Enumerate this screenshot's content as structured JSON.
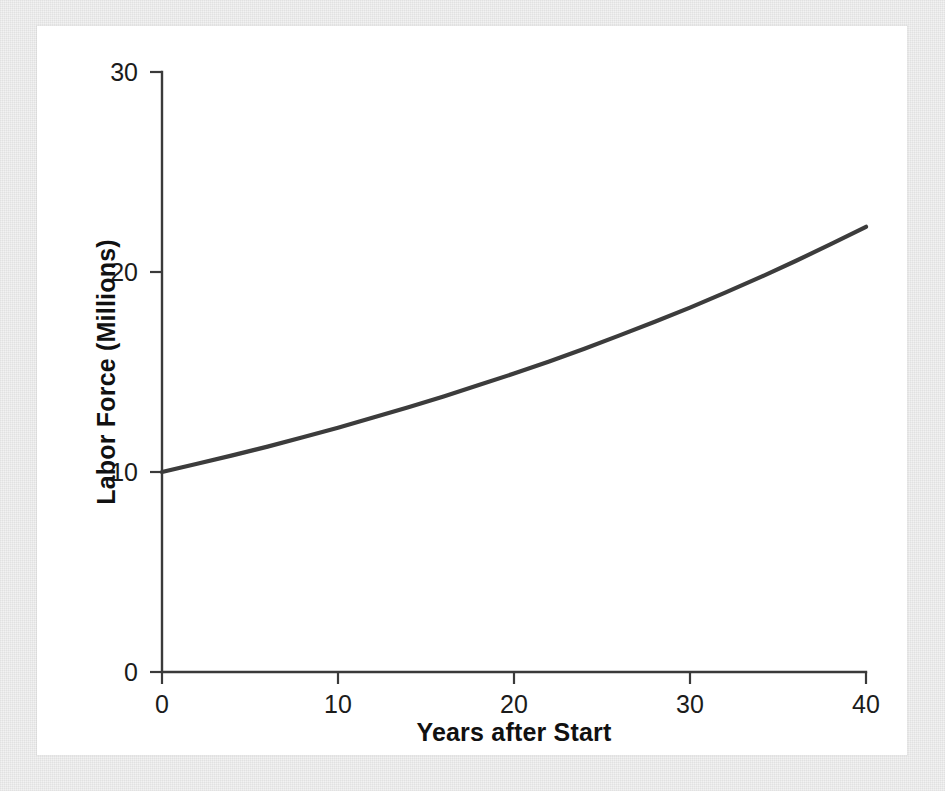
{
  "figure": {
    "background_color": "#f2f2f2",
    "panel_color": "#ffffff",
    "axis_color": "#3a3a3a",
    "curve_color": "#3c3c3c"
  },
  "chart_data": {
    "type": "line",
    "title": "",
    "subtitle": "",
    "xlabel": "Years after Start",
    "ylabel": "Labor Force (Millions)",
    "xlim": [
      0,
      40
    ],
    "ylim": [
      0,
      30
    ],
    "xticks": [
      0,
      10,
      20,
      30,
      40
    ],
    "yticks": [
      0,
      10,
      20,
      30
    ],
    "xtick_labels": [
      "0",
      "10",
      "20",
      "30",
      "40"
    ],
    "ytick_labels": [
      "0",
      "10",
      "20",
      "30"
    ],
    "grid": false,
    "legend": null,
    "legend_position": "none",
    "annotations": [],
    "series": [
      {
        "name": "Labor Force",
        "color": "#3c3c3c",
        "line_width": 4.2,
        "x": [
          0,
          2,
          4,
          6,
          8,
          10,
          12,
          14,
          16,
          18,
          20,
          22,
          24,
          26,
          28,
          30,
          32,
          34,
          36,
          38,
          40
        ],
        "values": [
          10.0,
          10.41,
          10.83,
          11.27,
          11.74,
          12.21,
          12.72,
          13.24,
          13.78,
          14.35,
          14.92,
          15.53,
          16.16,
          16.83,
          17.51,
          18.22,
          18.97,
          19.74,
          20.55,
          21.39,
          22.26
        ]
      }
    ]
  },
  "axes": {
    "x_tick_text": [
      "0",
      "10",
      "20",
      "30",
      "40"
    ],
    "y_tick_text": [
      "0",
      "10",
      "20",
      "30"
    ],
    "x_title": "Years after Start",
    "y_title": "Labor Force (Millions)"
  }
}
